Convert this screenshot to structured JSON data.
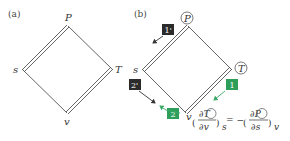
{
  "panels": [
    {
      "id": "a",
      "label": "(a)",
      "vertices": {
        "top": "P",
        "left": "s",
        "right": "T",
        "bottom": "v"
      },
      "double_edges": [
        "P-s",
        "T-v"
      ],
      "circled": []
    },
    {
      "id": "b",
      "label": "(b)",
      "vertices": {
        "top": "P",
        "left": "s",
        "right": "T",
        "bottom": "v"
      },
      "double_edges": [
        "P-s",
        "T-v"
      ],
      "circled": [
        "P",
        "T"
      ],
      "steps": [
        {
          "label": "1'",
          "color": "#2b2b2b",
          "arrow": "down-left"
        },
        {
          "label": "2'",
          "color": "#2b2b2b",
          "arrow": "down-right"
        },
        {
          "label": "1",
          "color": "#2e9e5b",
          "arrow": "down-left"
        },
        {
          "label": "2",
          "color": "#2e9e5b",
          "arrow": "up-left"
        }
      ],
      "equation": {
        "lhs_num": "∂T",
        "lhs_den": "∂v",
        "lhs_sub": "s",
        "equals": "= −",
        "rhs_num": "∂P",
        "rhs_den": "∂s",
        "rhs_sub": "v"
      }
    }
  ],
  "colors": {
    "line": "#555555",
    "dark_box": "#2b2b2b",
    "green_box": "#2e9e5b",
    "green_arrow": "#3aa866"
  }
}
